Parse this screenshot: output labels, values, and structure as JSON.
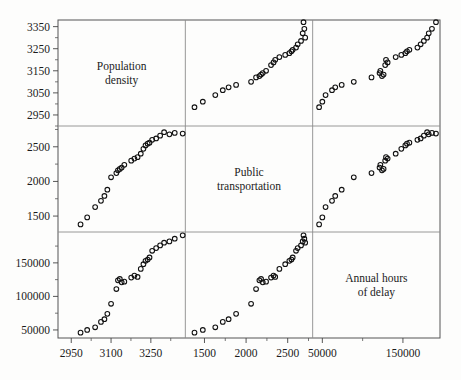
{
  "figure": {
    "type": "scatter-plot-matrix",
    "variables": [
      "Population density",
      "Public transportation",
      "Annual hours of delay"
    ],
    "background_color": "#fdfdfc",
    "marker_color": "#111111",
    "axis_color": "#555555"
  },
  "diagonal_labels": [
    {
      "line1": "Population",
      "line2": "density"
    },
    {
      "line1": "Public",
      "line2": "transportation"
    },
    {
      "line1": "Annual hours",
      "line2": "of delay"
    }
  ],
  "axes": {
    "row1_y_ticks": [
      "3350",
      "3250",
      "3150",
      "3050",
      "2950"
    ],
    "row1_y_values": [
      3350,
      3250,
      3150,
      3050,
      2950
    ],
    "row2_y_ticks": [
      "2500",
      "2000",
      "1500"
    ],
    "row2_y_values": [
      2500,
      2000,
      1500
    ],
    "row3_y_ticks": [
      "150000",
      "100000",
      "50000"
    ],
    "row3_y_values": [
      150000,
      100000,
      50000
    ],
    "col1_x_ticks": [
      "2950",
      "3100",
      "3250"
    ],
    "col1_x_values": [
      2950,
      3100,
      3250
    ],
    "col2_x_ticks": [
      "1500",
      "2000",
      "2500"
    ],
    "col2_x_values": [
      1500,
      2000,
      2500
    ],
    "col3_x_ticks": [
      "50000",
      "150000"
    ],
    "col3_x_values": [
      50000,
      150000
    ],
    "col1_range": [
      2900,
      3380
    ],
    "col2_range": [
      1270,
      2800
    ],
    "col3_range": [
      38000,
      196000
    ],
    "row1_range": [
      2900,
      3380
    ],
    "row2_range": [
      1270,
      2800
    ],
    "row3_range": [
      38000,
      196000
    ]
  },
  "chart_data": {
    "type": "scatter",
    "title": "",
    "xlabel": "",
    "ylabel": "",
    "grid": true,
    "legend_position": "none",
    "variables": [
      "density",
      "transit",
      "delay"
    ],
    "points": [
      {
        "density": 3370,
        "transit": 2690,
        "delay": 191000
      },
      {
        "density": 3340,
        "transit": 2700,
        "delay": 186000
      },
      {
        "density": 3320,
        "transit": 2680,
        "delay": 182000
      },
      {
        "density": 3300,
        "transit": 2710,
        "delay": 180000
      },
      {
        "density": 3285,
        "transit": 2660,
        "delay": 176000
      },
      {
        "density": 3270,
        "transit": 2620,
        "delay": 172000
      },
      {
        "density": 3255,
        "transit": 2600,
        "delay": 168000
      },
      {
        "density": 3245,
        "transit": 2560,
        "delay": 158000
      },
      {
        "density": 3238,
        "transit": 2545,
        "delay": 155000
      },
      {
        "density": 3230,
        "transit": 2520,
        "delay": 153000
      },
      {
        "density": 3222,
        "transit": 2470,
        "delay": 148000
      },
      {
        "density": 3212,
        "transit": 2400,
        "delay": 141000
      },
      {
        "density": 3200,
        "transit": 2350,
        "delay": 129000
      },
      {
        "density": 3188,
        "transit": 2330,
        "delay": 131000
      },
      {
        "density": 3176,
        "transit": 2300,
        "delay": 128000
      },
      {
        "density": 3150,
        "transit": 2240,
        "delay": 122000
      },
      {
        "density": 3140,
        "transit": 2200,
        "delay": 121000
      },
      {
        "density": 3133,
        "transit": 2180,
        "delay": 126000
      },
      {
        "density": 3126,
        "transit": 2160,
        "delay": 124000
      },
      {
        "density": 3120,
        "transit": 2120,
        "delay": 111000
      },
      {
        "density": 3100,
        "transit": 2060,
        "delay": 89000
      },
      {
        "density": 3086,
        "transit": 1880,
        "delay": 74000
      },
      {
        "density": 3075,
        "transit": 1790,
        "delay": 66000
      },
      {
        "density": 3062,
        "transit": 1720,
        "delay": 62000
      },
      {
        "density": 3040,
        "transit": 1630,
        "delay": 54000
      },
      {
        "density": 3010,
        "transit": 1480,
        "delay": 50000
      },
      {
        "density": 2985,
        "transit": 1380,
        "delay": 46000
      }
    ]
  }
}
